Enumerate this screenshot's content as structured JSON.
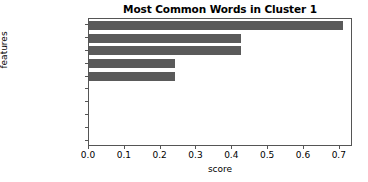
{
  "figure": {
    "background_color": "#ffffff",
    "axes_color": "#555555",
    "bar_color": "#5a5a5a"
  },
  "chart_data": {
    "type": "bar",
    "orientation": "horizontal",
    "title": "Most Common Words in Cluster 1",
    "xlabel": "score",
    "ylabel": "features",
    "categories": [
      "global_hr",
      "warn",
      "memori",
      "util",
      "state",
      "www",
      "failur",
      "em",
      "emp_tsm",
      "employee_lm"
    ],
    "values": [
      0.71,
      0.425,
      0.425,
      0.24,
      0.24,
      0.0,
      0.0,
      0.0,
      0.0,
      0.0
    ],
    "xlim": [
      0.0,
      0.7368
    ],
    "xticks": [
      0.0,
      0.1,
      0.2,
      0.3,
      0.4,
      0.5,
      0.6,
      0.7
    ],
    "xtick_labels": [
      "0.0",
      "0.1",
      "0.2",
      "0.3",
      "0.4",
      "0.5",
      "0.6",
      "0.7"
    ],
    "grid": false,
    "legend": null
  }
}
